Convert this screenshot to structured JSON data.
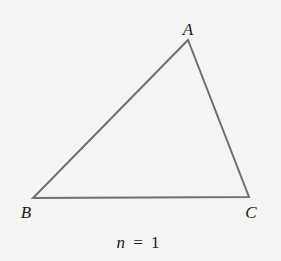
{
  "diagram": {
    "type": "triangle",
    "stroke_color": "#6f6f6f",
    "background": "#f4f4f2",
    "vertices": [
      {
        "label": "A",
        "x": 188,
        "y": 40
      },
      {
        "label": "B",
        "x": 33,
        "y": 198
      },
      {
        "label": "C",
        "x": 249,
        "y": 197
      }
    ],
    "caption": {
      "variable": "n",
      "equals": "=",
      "value": "1"
    }
  }
}
